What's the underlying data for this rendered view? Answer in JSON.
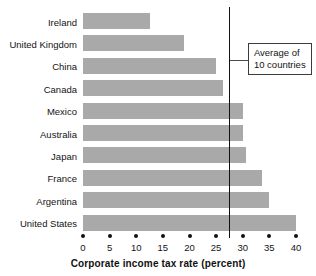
{
  "chart_data": {
    "type": "bar",
    "orientation": "horizontal",
    "title": "",
    "xlabel": "Corporate income tax rate (percent)",
    "ylabel": "",
    "categories": [
      "Ireland",
      "United Kingdom",
      "China",
      "Canada",
      "Mexico",
      "Australia",
      "Japan",
      "France",
      "Argentina",
      "United States"
    ],
    "values": [
      12.5,
      19.0,
      25.0,
      26.3,
      30.0,
      30.0,
      30.6,
      33.6,
      35.0,
      40.0
    ],
    "xlim": [
      0,
      40
    ],
    "xticks": [
      0,
      5,
      10,
      15,
      20,
      25,
      30,
      35,
      40
    ],
    "xtick_labels": [
      "0",
      "5",
      "10",
      "15",
      "20",
      "25",
      "30",
      "35",
      "40"
    ],
    "grid": false,
    "legend": null,
    "bar_color": "#a9a9a9",
    "annotations": [
      {
        "name": "average-line",
        "type": "vline",
        "value": 27.4,
        "label_line_1": "Average of",
        "label_line_2": "10 countries",
        "color": "#111111"
      }
    ]
  },
  "axis": {
    "title": "Corporate income tax rate (percent)"
  },
  "callout": {
    "line1": "Average of",
    "line2": "10 countries"
  }
}
